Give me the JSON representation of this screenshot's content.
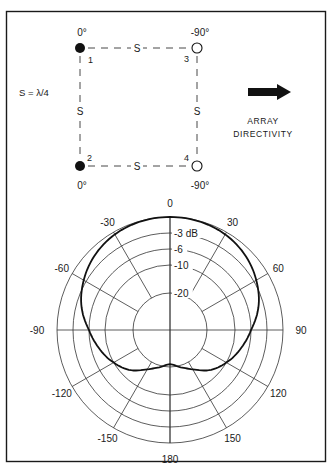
{
  "array": {
    "spacing_note": "S = λ/4",
    "elements": [
      {
        "id": "1",
        "phase": "0°",
        "fill": "filled",
        "x": 80,
        "y": 48
      },
      {
        "id": "2",
        "phase": "0°",
        "fill": "filled",
        "x": 80,
        "y": 166
      },
      {
        "id": "3",
        "phase": "-90°",
        "fill": "open",
        "x": 197,
        "y": 48
      },
      {
        "id": "4",
        "phase": "-90°",
        "fill": "open",
        "x": 197,
        "y": 166
      }
    ],
    "side_labels": {
      "top": "S",
      "bottom": "S",
      "left": "S",
      "right": "S"
    },
    "directivity_label_line1": "ARRAY",
    "directivity_label_line2": "DIRECTIVITY"
  },
  "chart_data": {
    "type": "polar",
    "title": "",
    "angle_ticks": [
      0,
      30,
      60,
      90,
      120,
      150,
      180,
      -150,
      -120,
      -90,
      -60,
      -30
    ],
    "angle_labels": [
      "0",
      "30",
      "60",
      "90",
      "120",
      "150",
      "180",
      "-150",
      "-120",
      "-90",
      "-60",
      "-30"
    ],
    "ring_levels_db": [
      0,
      -3,
      -6,
      -10,
      -20
    ],
    "ring_labels": [
      "-3 dB",
      "-6",
      "-10",
      "-20"
    ],
    "ring_radius_px": {
      "0": 113,
      "-3": 97,
      "-6": 81,
      "-10": 65,
      "-20": 37
    },
    "series": [
      {
        "name": "array pattern",
        "angles_deg": [
          0,
          15,
          30,
          45,
          60,
          75,
          90,
          105,
          120,
          135,
          150,
          165,
          180,
          -165,
          -150,
          -135,
          -120,
          -105,
          -90,
          -75,
          -60,
          -45,
          -30,
          -15
        ],
        "values_db": [
          0,
          -0.1,
          -0.5,
          -1.3,
          -2.5,
          -4.0,
          -6.0,
          -8.0,
          -10.0,
          -13.0,
          -17.0,
          -19.5,
          -21.0,
          -19.5,
          -17.0,
          -13.0,
          -10.0,
          -8.0,
          -6.0,
          -4.0,
          -2.5,
          -1.3,
          -0.5,
          -0.1
        ]
      }
    ]
  }
}
